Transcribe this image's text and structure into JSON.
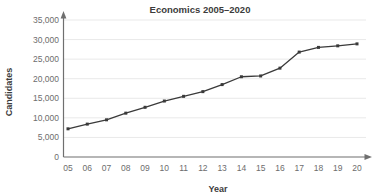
{
  "chart_data": {
    "type": "line",
    "title": "Economics 2005–2020",
    "xlabel": "Year",
    "ylabel": "Candidates",
    "categories": [
      "05",
      "06",
      "07",
      "08",
      "09",
      "10",
      "11",
      "12",
      "13",
      "14",
      "15",
      "16",
      "17",
      "18",
      "19",
      "20"
    ],
    "x_full_years": [
      2005,
      2006,
      2007,
      2008,
      2009,
      2010,
      2011,
      2012,
      2013,
      2014,
      2015,
      2016,
      2017,
      2018,
      2019,
      2020
    ],
    "values": [
      7200,
      8400,
      9500,
      11200,
      12700,
      14300,
      15500,
      16700,
      18500,
      20500,
      20700,
      22700,
      26800,
      28000,
      28400,
      28900
    ],
    "series": [
      {
        "name": "Candidates",
        "values": [
          7200,
          8400,
          9500,
          11200,
          12700,
          14300,
          15500,
          16700,
          18500,
          20500,
          20700,
          22700,
          26800,
          28000,
          28400,
          28900
        ]
      }
    ],
    "ylim": [
      0,
      35000
    ],
    "ytick_values": [
      0,
      5000,
      10000,
      15000,
      20000,
      25000,
      30000,
      35000
    ],
    "ytick_labels": [
      "0",
      "5,000",
      "10,000",
      "15,000",
      "20,000",
      "25,000",
      "30,000",
      "35,000"
    ],
    "grid": true,
    "legend": "none",
    "marker": "square",
    "line_color": "#3a3a3a",
    "grid_color": "#e9e9e9",
    "axis_color": "#6f6f6f",
    "text_color": "#3c3c3c",
    "tick_color": "#6d6d6d"
  }
}
